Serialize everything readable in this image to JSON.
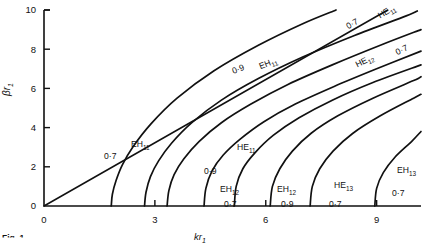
{
  "figure": {
    "caption": "Fig. 1",
    "axes": {
      "x": {
        "label": "kr1",
        "label_base": "kr",
        "label_sub": "1",
        "ticks": [
          0,
          3,
          6,
          9
        ],
        "min": 0,
        "max": 10.2,
        "tick_labels": [
          "0",
          "3",
          "6",
          "9"
        ]
      },
      "y": {
        "label": "βr1",
        "label_base": "βr",
        "label_sub": "1",
        "ticks": [
          0,
          2,
          4,
          6,
          8,
          10
        ],
        "min": 0,
        "max": 10,
        "tick_labels": [
          "0",
          "2",
          "4",
          "6",
          "8",
          "10"
        ]
      }
    },
    "annotations": [
      {
        "id": "a1",
        "text": "EH11",
        "base": "EH",
        "sub": "11",
        "x": 131,
        "y": 140,
        "rot": 0
      },
      {
        "id": "a2",
        "text": "0·7",
        "base": "0·7",
        "sub": "",
        "x": 104,
        "y": 152,
        "rot": 0
      },
      {
        "id": "a3",
        "text": "0·9",
        "base": "0·9",
        "sub": "",
        "x": 234,
        "y": 67,
        "rot": -22
      },
      {
        "id": "a4",
        "text": "EH11",
        "base": "EH",
        "sub": "11",
        "x": 262,
        "y": 62,
        "rot": -22
      },
      {
        "id": "a5",
        "text": "0·7",
        "base": "0·7",
        "sub": "",
        "x": 349,
        "y": 22,
        "rot": -30
      },
      {
        "id": "a6",
        "text": "HE11",
        "base": "HE",
        "sub": "11",
        "x": 382,
        "y": 11,
        "rot": -30
      },
      {
        "id": "a7",
        "text": "0·7",
        "base": "0·7",
        "sub": "",
        "x": 398,
        "y": 48,
        "rot": -26
      },
      {
        "id": "a8",
        "text": "HE12",
        "base": "HE",
        "sub": "12",
        "x": 359,
        "y": 60,
        "rot": -26
      },
      {
        "id": "a9",
        "text": "HE11",
        "base": "HE",
        "sub": "11",
        "x": 237,
        "y": 143,
        "rot": 0
      },
      {
        "id": "a10",
        "text": "0·9",
        "base": "0·9",
        "sub": "",
        "x": 204,
        "y": 167,
        "rot": 0
      },
      {
        "id": "a11",
        "text": "EH12",
        "base": "EH",
        "sub": "12",
        "x": 220,
        "y": 185,
        "rot": 0
      },
      {
        "id": "a12",
        "text": "0·7",
        "base": "0·7",
        "sub": "",
        "x": 224,
        "y": 200,
        "rot": 0
      },
      {
        "id": "a13",
        "text": "EH12",
        "base": "EH",
        "sub": "12",
        "x": 277,
        "y": 185,
        "rot": 0
      },
      {
        "id": "a14",
        "text": "0·9",
        "base": "0·9",
        "sub": "",
        "x": 281,
        "y": 200,
        "rot": 0
      },
      {
        "id": "a15",
        "text": "HE13",
        "base": "HE",
        "sub": "13",
        "x": 334,
        "y": 181,
        "rot": 0
      },
      {
        "id": "a16",
        "text": "0·7",
        "base": "0·7",
        "sub": "",
        "x": 329,
        "y": 200,
        "rot": 0
      },
      {
        "id": "a17",
        "text": "EH13",
        "base": "EH",
        "sub": "13",
        "x": 397,
        "y": 166,
        "rot": 0
      },
      {
        "id": "a18",
        "text": "0·7",
        "base": "0·7",
        "sub": "",
        "x": 392,
        "y": 189,
        "rot": 0
      }
    ]
  },
  "chart_data": {
    "type": "line",
    "title": "",
    "xlabel": "kr1",
    "ylabel": "βr1",
    "xlim": [
      0,
      10.2
    ],
    "ylim": [
      0,
      10
    ],
    "xticks": [
      0,
      3,
      6,
      9
    ],
    "yticks": [
      0,
      2,
      4,
      6,
      8,
      10
    ],
    "grid": false,
    "legend": "none",
    "series": [
      {
        "name": "light-line",
        "label": "",
        "ratio": "",
        "points": [
          [
            0,
            0
          ],
          [
            2,
            2.15
          ],
          [
            4,
            4.3
          ],
          [
            6,
            6.45
          ],
          [
            8,
            8.6
          ],
          [
            9.3,
            10.0
          ]
        ]
      },
      {
        "name": "EH11 0.7",
        "label": "EH11",
        "ratio": "0·7",
        "points": [
          [
            1.82,
            0
          ],
          [
            1.85,
            0.6
          ],
          [
            1.95,
            1.3
          ],
          [
            2.12,
            2.1
          ],
          [
            2.4,
            3.0
          ],
          [
            2.9,
            4.2
          ],
          [
            3.6,
            5.5
          ],
          [
            4.6,
            6.9
          ],
          [
            5.8,
            8.2
          ],
          [
            7.0,
            9.3
          ],
          [
            7.9,
            10.0
          ]
        ]
      },
      {
        "name": "EH11 0.9",
        "label": "EH11",
        "ratio": "0·9",
        "points": [
          [
            2.72,
            0
          ],
          [
            2.76,
            0.7
          ],
          [
            2.88,
            1.5
          ],
          [
            3.1,
            2.3
          ],
          [
            3.45,
            3.2
          ],
          [
            4.0,
            4.25
          ],
          [
            4.8,
            5.4
          ],
          [
            5.8,
            6.5
          ],
          [
            7.0,
            7.6
          ],
          [
            8.4,
            8.7
          ],
          [
            9.8,
            9.7
          ],
          [
            10.1,
            9.95
          ]
        ]
      },
      {
        "name": "HE11 0.7",
        "label": "HE11",
        "ratio": "0·7",
        "points": [
          [
            3.33,
            0
          ],
          [
            3.38,
            0.8
          ],
          [
            3.52,
            1.6
          ],
          [
            3.78,
            2.4
          ],
          [
            4.2,
            3.3
          ],
          [
            4.8,
            4.25
          ],
          [
            5.6,
            5.2
          ],
          [
            6.6,
            6.2
          ],
          [
            7.8,
            7.2
          ],
          [
            9.1,
            8.2
          ],
          [
            10.2,
            9.0
          ]
        ]
      },
      {
        "name": "HE11 0.9",
        "label": "HE11",
        "ratio": "0·9",
        "points": [
          [
            4.33,
            0
          ],
          [
            4.38,
            0.9
          ],
          [
            4.55,
            1.8
          ],
          [
            4.85,
            2.6
          ],
          [
            5.3,
            3.4
          ],
          [
            5.95,
            4.3
          ],
          [
            6.8,
            5.2
          ],
          [
            7.85,
            6.1
          ],
          [
            9.0,
            7.0
          ],
          [
            10.2,
            7.9
          ]
        ]
      },
      {
        "name": "EH12 0.7",
        "label": "EH12",
        "ratio": "0·7",
        "points": [
          [
            5.15,
            0
          ],
          [
            5.2,
            1.0
          ],
          [
            5.38,
            1.9
          ],
          [
            5.7,
            2.7
          ],
          [
            6.2,
            3.6
          ],
          [
            6.9,
            4.5
          ],
          [
            7.8,
            5.4
          ],
          [
            8.9,
            6.3
          ],
          [
            10.2,
            7.2
          ]
        ]
      },
      {
        "name": "EH12 0.9",
        "label": "EH12",
        "ratio": "0·9",
        "points": [
          [
            6.12,
            0
          ],
          [
            6.18,
            1.0
          ],
          [
            6.38,
            1.9
          ],
          [
            6.72,
            2.8
          ],
          [
            7.22,
            3.7
          ],
          [
            7.95,
            4.6
          ],
          [
            8.9,
            5.5
          ],
          [
            10.0,
            6.4
          ],
          [
            10.2,
            6.6
          ]
        ]
      },
      {
        "name": "HE13 0.7",
        "label": "HE13",
        "ratio": "0·7",
        "points": [
          [
            7.2,
            0
          ],
          [
            7.26,
            1.0
          ],
          [
            7.46,
            1.9
          ],
          [
            7.82,
            2.8
          ],
          [
            8.35,
            3.7
          ],
          [
            9.1,
            4.6
          ],
          [
            10.0,
            5.5
          ],
          [
            10.2,
            5.7
          ]
        ]
      },
      {
        "name": "EH13 0.7",
        "label": "EH13",
        "ratio": "0·7",
        "points": [
          [
            8.95,
            0
          ],
          [
            9.0,
            0.9
          ],
          [
            9.18,
            1.7
          ],
          [
            9.5,
            2.5
          ],
          [
            9.95,
            3.3
          ],
          [
            10.2,
            3.8
          ]
        ]
      }
    ]
  }
}
